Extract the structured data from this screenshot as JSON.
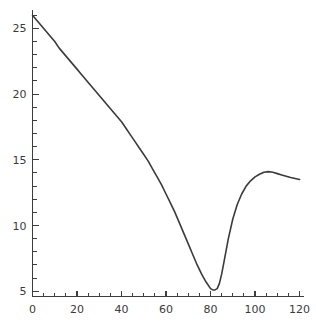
{
  "chart_data": {
    "type": "line",
    "title": "",
    "subtitle": "",
    "xlabel": "",
    "ylabel": "",
    "xlim": [
      0,
      122
    ],
    "ylim": [
      4.6,
      26.4
    ],
    "grid": false,
    "legend": null,
    "legend_position": "none",
    "x_ticks_major": [
      0,
      20,
      40,
      60,
      80,
      100,
      120
    ],
    "x_tick_labels": [
      "0",
      "20",
      "40",
      "60",
      "80",
      "100",
      "120"
    ],
    "x_tick_minor_step": 5,
    "y_ticks_major": [
      5,
      10,
      15,
      20,
      25
    ],
    "y_tick_labels": [
      "5",
      "10",
      "15",
      "20",
      "25"
    ],
    "y_tick_minor_step": 1,
    "series": [
      {
        "name": "series-1",
        "color": "#3b3b3b",
        "x": [
          0,
          2,
          4,
          6,
          8,
          10,
          12,
          14,
          16,
          18,
          20,
          22,
          24,
          26,
          28,
          30,
          32,
          34,
          36,
          38,
          40,
          42,
          44,
          46,
          48,
          50,
          52,
          54,
          56,
          58,
          60,
          62,
          64,
          66,
          68,
          70,
          72,
          74,
          76,
          78,
          80,
          81,
          82,
          83,
          84,
          85,
          86,
          88,
          90,
          92,
          94,
          96,
          98,
          100,
          102,
          104,
          106,
          108,
          110,
          112,
          114,
          116,
          118,
          120
        ],
        "y": [
          26.0,
          25.6,
          25.2,
          24.8,
          24.4,
          24.0,
          23.5,
          23.1,
          22.7,
          22.3,
          21.9,
          21.5,
          21.1,
          20.7,
          20.3,
          19.9,
          19.5,
          19.1,
          18.7,
          18.3,
          17.9,
          17.4,
          16.9,
          16.4,
          15.9,
          15.4,
          14.9,
          14.3,
          13.7,
          13.1,
          12.4,
          11.7,
          11.0,
          10.2,
          9.4,
          8.6,
          7.8,
          7.0,
          6.3,
          5.7,
          5.2,
          5.1,
          5.1,
          5.2,
          5.6,
          6.3,
          7.2,
          9.0,
          10.5,
          11.6,
          12.4,
          13.0,
          13.4,
          13.7,
          13.9,
          14.05,
          14.1,
          14.05,
          13.95,
          13.85,
          13.75,
          13.65,
          13.58,
          13.5
        ]
      }
    ]
  },
  "axes": {
    "x_axis_name": "x-axis",
    "y_axis_name": "y-axis"
  }
}
